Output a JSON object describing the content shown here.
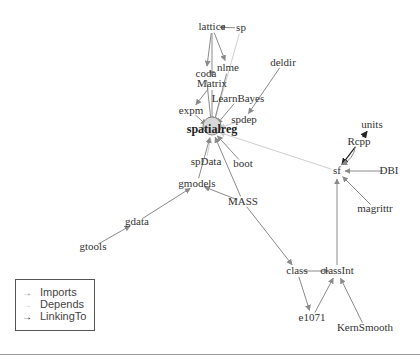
{
  "diagram": {
    "type": "package-dependency-graph",
    "focus_node": "spatialreg",
    "colors": {
      "imports": "#8a8a8a",
      "depends": "#cfcfcf",
      "linkingto": "#222222",
      "label": "#333333"
    },
    "nodes": [
      {
        "id": "lattice",
        "label": "lattice",
        "x": 212,
        "y": 27
      },
      {
        "id": "sp",
        "label": "sp",
        "x": 241,
        "y": 28
      },
      {
        "id": "nlme",
        "label": "nlme",
        "x": 228,
        "y": 68
      },
      {
        "id": "deldir",
        "label": "deldir",
        "x": 283,
        "y": 63
      },
      {
        "id": "coda",
        "label": "coda",
        "x": 206,
        "y": 74
      },
      {
        "id": "Matrix",
        "label": "Matrix",
        "x": 212,
        "y": 84
      },
      {
        "id": "LearnBayes",
        "label": "LearnBayes",
        "x": 238,
        "y": 99
      },
      {
        "id": "expm",
        "label": "expm",
        "x": 191,
        "y": 111
      },
      {
        "id": "spdep",
        "label": "spdep",
        "x": 244,
        "y": 120
      },
      {
        "id": "spatialreg",
        "label": "spatialreg",
        "x": 212,
        "y": 130,
        "focus": true
      },
      {
        "id": "spData",
        "label": "spData",
        "x": 206,
        "y": 162
      },
      {
        "id": "boot",
        "label": "boot",
        "x": 243,
        "y": 164
      },
      {
        "id": "gmodels",
        "label": "gmodels",
        "x": 197,
        "y": 184
      },
      {
        "id": "MASS",
        "label": "MASS",
        "x": 243,
        "y": 202
      },
      {
        "id": "gdata",
        "label": "gdata",
        "x": 137,
        "y": 222
      },
      {
        "id": "gtools",
        "label": "gtools",
        "x": 93,
        "y": 247
      },
      {
        "id": "units",
        "label": "units",
        "x": 372,
        "y": 125
      },
      {
        "id": "Rcpp",
        "label": "Rcpp",
        "x": 359,
        "y": 142
      },
      {
        "id": "sf",
        "label": "sf",
        "x": 337,
        "y": 171
      },
      {
        "id": "DBI",
        "label": "DBI",
        "x": 389,
        "y": 171
      },
      {
        "id": "magrittr",
        "label": "magrittr",
        "x": 375,
        "y": 209
      },
      {
        "id": "class",
        "label": "class",
        "x": 297,
        "y": 271
      },
      {
        "id": "classInt",
        "label": "classInt",
        "x": 337,
        "y": 271
      },
      {
        "id": "e1071",
        "label": "e1071",
        "x": 312,
        "y": 318
      },
      {
        "id": "KernSmooth",
        "label": "KernSmooth",
        "x": 365,
        "y": 328
      }
    ],
    "edges": [
      {
        "from": "sp",
        "to": "lattice",
        "type": "imports"
      },
      {
        "from": "lattice",
        "to": "coda",
        "type": "imports"
      },
      {
        "from": "lattice",
        "to": "nlme",
        "type": "imports"
      },
      {
        "from": "lattice",
        "to": "Matrix",
        "type": "imports"
      },
      {
        "from": "sp",
        "to": "spatialreg",
        "type": "depends"
      },
      {
        "from": "nlme",
        "to": "spatialreg",
        "type": "imports"
      },
      {
        "from": "coda",
        "to": "spatialreg",
        "type": "imports"
      },
      {
        "from": "Matrix",
        "to": "spatialreg",
        "type": "imports"
      },
      {
        "from": "Matrix",
        "to": "expm",
        "type": "imports"
      },
      {
        "from": "deldir",
        "to": "spdep",
        "type": "imports"
      },
      {
        "from": "LearnBayes",
        "to": "spatialreg",
        "type": "imports"
      },
      {
        "from": "expm",
        "to": "spatialreg",
        "type": "imports"
      },
      {
        "from": "spdep",
        "to": "spatialreg",
        "type": "depends"
      },
      {
        "from": "spData",
        "to": "spatialreg",
        "type": "depends"
      },
      {
        "from": "boot",
        "to": "spatialreg",
        "type": "imports"
      },
      {
        "from": "gmodels",
        "to": "spatialreg",
        "type": "imports"
      },
      {
        "from": "MASS",
        "to": "spatialreg",
        "type": "imports"
      },
      {
        "from": "MASS",
        "to": "gmodels",
        "type": "imports"
      },
      {
        "from": "gdata",
        "to": "gmodels",
        "type": "imports"
      },
      {
        "from": "gtools",
        "to": "gdata",
        "type": "imports"
      },
      {
        "from": "sf",
        "to": "spatialreg",
        "type": "depends"
      },
      {
        "from": "Rcpp",
        "to": "units",
        "type": "linkingto"
      },
      {
        "from": "Rcpp",
        "to": "sf",
        "type": "linkingto"
      },
      {
        "from": "Rcpp",
        "to": "sf",
        "type": "imports",
        "curve": true
      },
      {
        "from": "DBI",
        "to": "sf",
        "type": "imports"
      },
      {
        "from": "magrittr",
        "to": "sf",
        "type": "imports"
      },
      {
        "from": "classInt",
        "to": "sf",
        "type": "imports"
      },
      {
        "from": "MASS",
        "to": "class",
        "type": "imports"
      },
      {
        "from": "class",
        "to": "classInt",
        "type": "imports"
      },
      {
        "from": "class",
        "to": "e1071",
        "type": "imports"
      },
      {
        "from": "e1071",
        "to": "classInt",
        "type": "imports"
      },
      {
        "from": "KernSmooth",
        "to": "classInt",
        "type": "imports"
      }
    ]
  },
  "legend": {
    "items": [
      {
        "label": "Imports",
        "type": "imports"
      },
      {
        "label": "Depends",
        "type": "depends"
      },
      {
        "label": "LinkingTo",
        "type": "linkingto"
      }
    ]
  }
}
